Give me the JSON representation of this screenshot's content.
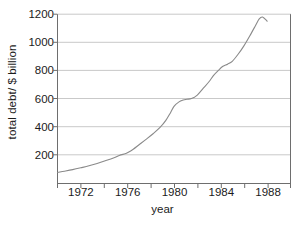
{
  "chart_data": {
    "type": "line",
    "title": "",
    "xlabel": "year",
    "ylabel": "total debt/ $ billion",
    "xlim": [
      1970,
      1990
    ],
    "ylim": [
      0,
      1200
    ],
    "grid": true,
    "grid_axis": "y",
    "legend": "none",
    "line_color": "#8a8a8a",
    "axis_color": "#6e6e6e",
    "grid_color": "#c9c9c9",
    "text_color": "#1b1b1b",
    "background": "#ffffff",
    "xticks": [
      1970,
      1972,
      1974,
      1976,
      1978,
      1980,
      1982,
      1984,
      1986,
      1988,
      1990
    ],
    "xtick_labels": [
      "1972",
      "1976",
      "1980",
      "1984",
      "1988"
    ],
    "xtick_label_values": [
      1972,
      1976,
      1980,
      1984,
      1988
    ],
    "yticks": [
      200,
      400,
      600,
      800,
      1000,
      1200
    ],
    "ytick_labels": [
      "200",
      "400",
      "600",
      "800",
      "1000",
      "1200"
    ],
    "x": [
      1970.0,
      1970.6,
      1971.3,
      1972.0,
      1972.7,
      1973.4,
      1974.1,
      1974.8,
      1975.3,
      1975.8,
      1976.0,
      1976.5,
      1977.0,
      1977.6,
      1978.2,
      1978.8,
      1979.3,
      1979.7,
      1980.0,
      1980.4,
      1980.8,
      1981.1,
      1981.5,
      1982.0,
      1982.5,
      1983.0,
      1983.4,
      1983.8,
      1984.2,
      1984.6,
      1985.0,
      1985.5,
      1986.0,
      1986.5,
      1987.0,
      1987.3,
      1987.6,
      1988.0
    ],
    "y": [
      75,
      84,
      95,
      108,
      122,
      139,
      158,
      178,
      196,
      208,
      215,
      240,
      272,
      310,
      350,
      395,
      445,
      500,
      545,
      575,
      590,
      595,
      600,
      625,
      672,
      720,
      765,
      800,
      830,
      845,
      865,
      915,
      975,
      1045,
      1120,
      1165,
      1180,
      1150
    ],
    "series_name": "total debt",
    "units": "$ billion"
  },
  "axes": {
    "y_axis_label": "total debt/ $ billion",
    "x_axis_label": "year"
  }
}
